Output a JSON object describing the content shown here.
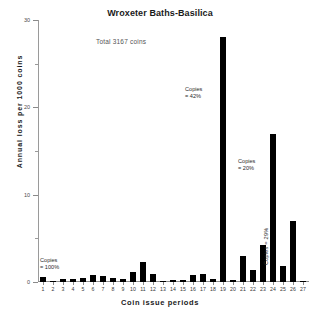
{
  "chart_data": {
    "type": "bar",
    "title": "Wroxeter Baths-Basilica",
    "subtitle": "Total  3167 coins",
    "xlabel": "Coin issue periods",
    "ylabel": "Annual loss per 1000 coins",
    "ylim": [
      0,
      30
    ],
    "yticks": [
      0,
      10,
      20,
      30
    ],
    "ytick_labels": [
      "0",
      "10",
      "20",
      "30"
    ],
    "grid": false,
    "legend": null,
    "categories": [
      "1",
      "2",
      "3",
      "4",
      "5",
      "6",
      "7",
      "8",
      "9",
      "10",
      "11",
      "12",
      "13",
      "14",
      "15",
      "16",
      "17",
      "18",
      "19",
      "20",
      "21",
      "22",
      "23",
      "24",
      "25",
      "26",
      "27"
    ],
    "values": [
      0.55,
      0.15,
      0.3,
      0.35,
      0.45,
      0.75,
      0.7,
      0.5,
      0.3,
      1.2,
      2.3,
      0.9,
      0.1,
      0.2,
      0.25,
      0.75,
      0.95,
      0.3,
      28.0,
      0.25,
      3.0,
      1.35,
      4.2,
      17.0,
      1.85,
      7.0,
      0.12
    ],
    "annotations": [
      {
        "text_line1": "Copies",
        "text_line2": "= 100%",
        "target_period": "1",
        "orientation": "horizontal"
      },
      {
        "text_line1": "Copies",
        "text_line2": "= 42%",
        "target_period": "19",
        "orientation": "horizontal"
      },
      {
        "text_line1": "Copies",
        "text_line2": "= 20%",
        "target_period": "24",
        "orientation": "horizontal"
      },
      {
        "text_line1": "Copies = 29%",
        "text_line2": "",
        "target_period": "26",
        "orientation": "vertical"
      }
    ],
    "colors": {
      "bar": "#000000",
      "axis": "#8a8a8a",
      "text": "#1a1a1a",
      "note": "#555555",
      "background": "#ffffff"
    }
  }
}
